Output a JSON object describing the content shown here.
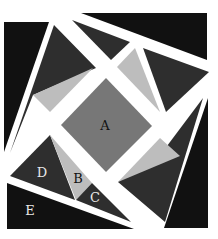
{
  "diagram": {
    "colors": {
      "background": "#ffffff",
      "black": "#111111",
      "dark": "#2e2e2e",
      "medium": "#777777",
      "light": "#bdbdbd",
      "label_dark": "#111111",
      "label_light": "#e8e8e8"
    },
    "pieces": [
      {
        "id": "left-black",
        "fill": "black",
        "points": "4,22 49,22 4,152"
      },
      {
        "id": "top-black",
        "fill": "black",
        "points": "81,13 207,13 207,60"
      },
      {
        "id": "right-black",
        "fill": "black",
        "points": "208,98 208,228 164,228"
      },
      {
        "id": "bottom-black-E",
        "fill": "black",
        "points": "7,183 134,229 7,229"
      },
      {
        "id": "upper-left-dark",
        "fill": "dark",
        "points": "54,25 96,68 33,95 10,153"
      },
      {
        "id": "upper-left-light",
        "fill": "light",
        "points": "33,95 93,68 50,112"
      },
      {
        "id": "top-mid-dark",
        "fill": "dark",
        "points": "72,20 130,42 111,60"
      },
      {
        "id": "top-right-light",
        "fill": "light",
        "points": "117,67 135,48 160,112"
      },
      {
        "id": "top-right-dark",
        "fill": "dark",
        "points": "143,48 209,72 166,112"
      },
      {
        "id": "right-dark",
        "fill": "dark",
        "points": "203,98 165,222 118,182 164,150"
      },
      {
        "id": "right-light",
        "fill": "light",
        "points": "118,182 160,138 180,156"
      },
      {
        "id": "center-A",
        "fill": "medium",
        "points": "106,78 152,126 106,172 61,125"
      },
      {
        "id": "piece-D",
        "fill": "dark",
        "points": "50,135 75,200 10,176"
      },
      {
        "id": "piece-B",
        "fill": "light",
        "points": "50,135 92,183 76,200"
      },
      {
        "id": "piece-C",
        "fill": "dark",
        "points": "92,183 131,222 76,200"
      }
    ],
    "labels": [
      {
        "text": "A",
        "x": 105,
        "y": 130,
        "color": "label_dark"
      },
      {
        "text": "B",
        "x": 78,
        "y": 183,
        "color": "label_dark"
      },
      {
        "text": "C",
        "x": 95,
        "y": 202,
        "color": "label_light"
      },
      {
        "text": "D",
        "x": 42,
        "y": 177,
        "color": "label_light"
      },
      {
        "text": "E",
        "x": 30,
        "y": 215,
        "color": "label_light"
      }
    ]
  }
}
